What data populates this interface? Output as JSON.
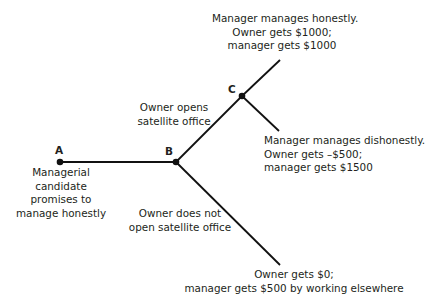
{
  "diagram": {
    "type": "game-tree",
    "colors": {
      "line": "#111111",
      "text": "#231f20",
      "background": "#ffffff"
    },
    "nodes": {
      "A": {
        "letter": "A",
        "x": 60,
        "y": 162,
        "description": [
          "Managerial",
          "candidate",
          "promises to",
          "manage honestly"
        ]
      },
      "B": {
        "letter": "B",
        "x": 176,
        "y": 162
      },
      "C": {
        "letter": "C",
        "x": 242,
        "y": 96
      }
    },
    "edges": {
      "open_office": {
        "label": [
          "Owner opens",
          "satellite office"
        ]
      },
      "not_open": {
        "label": [
          "Owner does not",
          "open satellite office"
        ]
      }
    },
    "outcomes": {
      "honest": [
        "Manager manages honestly.",
        "Owner gets $1000;",
        "manager gets $1000"
      ],
      "dishonest": [
        "Manager manages dishonestly.",
        "Owner gets –$500;",
        "manager gets $1500"
      ],
      "no_office": [
        "Owner gets $0;",
        "manager gets $500 by working elsewhere"
      ]
    }
  }
}
